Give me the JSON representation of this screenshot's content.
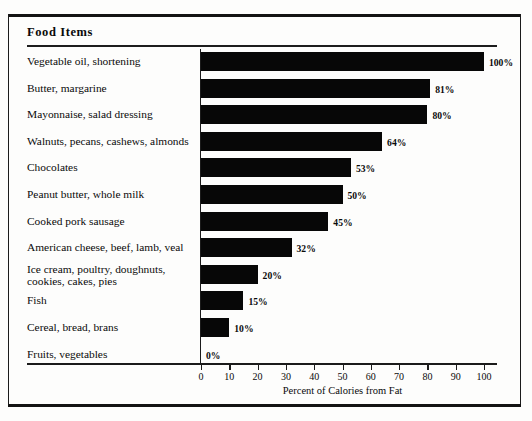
{
  "header": {
    "title": "Food  Items"
  },
  "chart_data": {
    "type": "bar",
    "orientation": "horizontal",
    "title": "Food  Items",
    "xlabel": "Percent of Calories from Fat",
    "ylabel": "",
    "xlim": [
      0,
      110
    ],
    "xticks": [
      0,
      10,
      20,
      30,
      40,
      50,
      60,
      70,
      80,
      90,
      100
    ],
    "xticklabels": [
      "0",
      "10",
      "20",
      "30",
      "40",
      "50",
      "60",
      "70",
      "80",
      "90",
      "100"
    ],
    "grid": false,
    "legend": null,
    "bar_color": "#070707",
    "categories": [
      "Vegetable oil, shortening",
      "Butter, margarine",
      "Mayonnaise, salad dressing",
      "Walnuts, pecans, cashews, almonds",
      "Chocolates",
      "Peanut butter, whole milk",
      "Cooked pork sausage",
      "American cheese, beef, lamb, veal",
      "Ice cream, poultry, doughnuts,\ncookies, cakes, pies",
      "Fish",
      "Cereal, bread, brans",
      "Fruits, vegetables"
    ],
    "values": [
      100,
      81,
      80,
      64,
      53,
      50,
      45,
      32,
      20,
      15,
      10,
      0
    ],
    "value_labels": [
      "100%",
      "81%",
      "80%",
      "64%",
      "53%",
      "50%",
      "45%",
      "32%",
      "20%",
      "15%",
      "10%",
      "0%"
    ]
  }
}
